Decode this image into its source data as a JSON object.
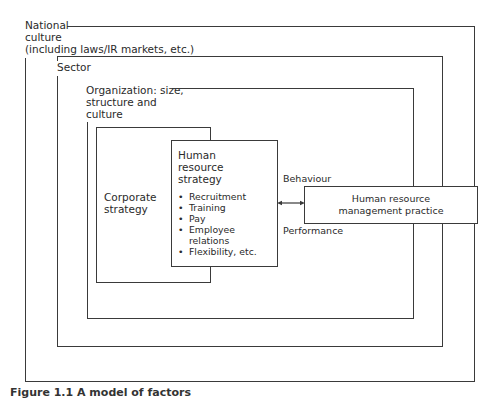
{
  "diagram": {
    "layers": [
      {
        "id": "national-culture",
        "label_lines": [
          "National",
          "culture",
          "(including laws/IR markets, etc.)"
        ]
      },
      {
        "id": "sector",
        "label_lines": [
          "Sector"
        ]
      },
      {
        "id": "organization",
        "label_lines": [
          "Organization: size,",
          "structure and",
          "culture"
        ]
      }
    ],
    "corporate_strategy": {
      "label_lines": [
        "Corporate",
        "strategy"
      ]
    },
    "hr_strategy": {
      "title_lines": [
        "Human",
        "resource",
        "strategy"
      ],
      "items": [
        "Recruitment",
        "Training",
        "Pay",
        "Employee relations",
        "Flexibility, etc."
      ]
    },
    "connector": {
      "type": "bidirectional-arrow",
      "label_top": "Behaviour",
      "label_bottom": "Performance"
    },
    "hrm_practice": {
      "label_lines": [
        "Human resource",
        "management practice"
      ]
    }
  },
  "caption": "Figure 1.1 A model of factors"
}
